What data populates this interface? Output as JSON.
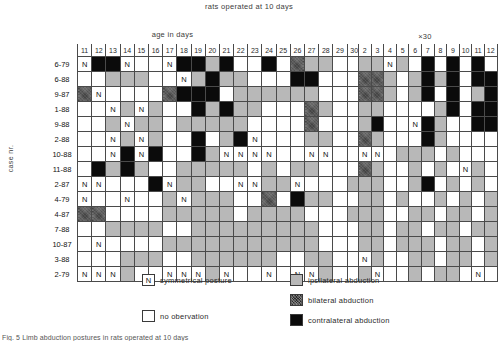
{
  "title": "rats operated at 10 days",
  "axes": {
    "x_label_left": "age in days",
    "x_label_right": "×30",
    "y_label": "case nr."
  },
  "legend": {
    "symmetrical": {
      "mark": "N",
      "label": "symmetrical posture"
    },
    "no_observation": {
      "mark": "",
      "label": "no obervation"
    },
    "ipsilateral": {
      "label": "ipsilateral abduction",
      "color": "#b8b8b8"
    },
    "bilateral": {
      "label": "bilateral abduction",
      "color": "#2b2b2b"
    },
    "contralateral": {
      "label": "contralateral abduction",
      "color": "#0b0b0b"
    }
  },
  "caption": "Fig. 5  Limb abduction postures in rats operated at 10 days",
  "chart_data": {
    "type": "heatmap",
    "title": "rats operated at 10 days",
    "xlabel": "age in days",
    "ylabel": "case nr.",
    "legend_position": "bottom",
    "states": {
      "n": "no obervation",
      "s": "symmetrical posture",
      "i": "ipsilateral abduction",
      "b": "bilateral abduction",
      "c": "contralateral abduction"
    },
    "panels": [
      {
        "name": "age-in-days",
        "xlabel": "age in days",
        "columns": [
          "11",
          "12",
          "13",
          "14",
          "15",
          "16",
          "17",
          "18",
          "19",
          "20",
          "21",
          "22",
          "23",
          "24",
          "25",
          "26",
          "27",
          "28",
          "29",
          "30",
          "31"
        ],
        "rows": [
          "6-79",
          "6-88",
          "9-87",
          "1-88",
          "9-88",
          "2-88",
          "10-88",
          "11-88",
          "2-87",
          "4-79",
          "4-87",
          "7-88",
          "10-87",
          "3-88",
          "2-79"
        ],
        "cells": [
          [
            "s",
            "c",
            "c",
            "s",
            "n",
            "n",
            "s",
            "c",
            "c",
            "i",
            "c",
            "n",
            "n",
            "c",
            "n",
            "b",
            "i",
            "i",
            "n",
            "n",
            "i"
          ],
          [
            "n",
            "n",
            "i",
            "i",
            "i",
            "n",
            "n",
            "s",
            "i",
            "c",
            "i",
            "i",
            "n",
            "n",
            "n",
            "c",
            "c",
            "n",
            "n",
            "n",
            "n"
          ],
          [
            "b",
            "s",
            "n",
            "n",
            "n",
            "n",
            "b",
            "c",
            "c",
            "c",
            "n",
            "i",
            "i",
            "i",
            "i",
            "i",
            "i",
            "n",
            "n",
            "n",
            "i"
          ],
          [
            "n",
            "n",
            "s",
            "i",
            "s",
            "i",
            "n",
            "n",
            "c",
            "i",
            "c",
            "i",
            "i",
            "n",
            "n",
            "n",
            "b",
            "i",
            "n",
            "n",
            "n"
          ],
          [
            "n",
            "n",
            "i",
            "s",
            "i",
            "i",
            "n",
            "i",
            "i",
            "i",
            "i",
            "i",
            "n",
            "n",
            "n",
            "n",
            "b",
            "n",
            "n",
            "n",
            "n"
          ],
          [
            "n",
            "n",
            "s",
            "i",
            "s",
            "i",
            "n",
            "n",
            "c",
            "n",
            "i",
            "c",
            "s",
            "n",
            "n",
            "n",
            "i",
            "i",
            "n",
            "n",
            "n"
          ],
          [
            "n",
            "n",
            "s",
            "c",
            "s",
            "c",
            "n",
            "n",
            "c",
            "i",
            "s",
            "s",
            "s",
            "s",
            "n",
            "n",
            "s",
            "s",
            "n",
            "n",
            "n"
          ],
          [
            "n",
            "c",
            "i",
            "c",
            "i",
            "n",
            "n",
            "i",
            "i",
            "i",
            "i",
            "i",
            "n",
            "i",
            "n",
            "i",
            "i",
            "n",
            "n",
            "n",
            "n"
          ],
          [
            "s",
            "s",
            "n",
            "n",
            "n",
            "c",
            "s",
            "i",
            "i",
            "n",
            "n",
            "s",
            "s",
            "i",
            "i",
            "s",
            "n",
            "n",
            "n",
            "i",
            "n"
          ],
          [
            "s",
            "n",
            "n",
            "s",
            "n",
            "n",
            "i",
            "s",
            "i",
            "i",
            "i",
            "n",
            "n",
            "b",
            "n",
            "c",
            "i",
            "i",
            "n",
            "n",
            "i"
          ],
          [
            "b",
            "b",
            "n",
            "n",
            "n",
            "n",
            "i",
            "i",
            "i",
            "i",
            "i",
            "n",
            "i",
            "i",
            "i",
            "i",
            "n",
            "n",
            "n",
            "i",
            "n"
          ],
          [
            "n",
            "n",
            "i",
            "i",
            "i",
            "i",
            "n",
            "n",
            "i",
            "i",
            "i",
            "i",
            "i",
            "i",
            "i",
            "i",
            "i",
            "n",
            "n",
            "n",
            "n"
          ],
          [
            "n",
            "s",
            "n",
            "n",
            "n",
            "n",
            "i",
            "i",
            "i",
            "i",
            "i",
            "i",
            "i",
            "i",
            "i",
            "i",
            "i",
            "n",
            "n",
            "n",
            "i"
          ],
          [
            "n",
            "n",
            "n",
            "i",
            "i",
            "i",
            "n",
            "n",
            "i",
            "i",
            "i",
            "i",
            "i",
            "i",
            "n",
            "n",
            "i",
            "i",
            "n",
            "n",
            "n"
          ],
          [
            "s",
            "s",
            "s",
            "i",
            "n",
            "n",
            "s",
            "s",
            "s",
            "i",
            "s",
            "n",
            "n",
            "s",
            "n",
            "s",
            "s",
            "i",
            "n",
            "n",
            "s"
          ]
        ]
      },
      {
        "name": "x30",
        "xlabel": "×30",
        "columns": [
          "2",
          "3",
          "4",
          "5",
          "6",
          "7",
          "8",
          "9",
          "10",
          "11",
          "12"
        ],
        "rows": [
          "6-79",
          "6-88",
          "9-87",
          "1-88",
          "9-88",
          "2-88",
          "10-88",
          "11-88",
          "2-87",
          "4-79",
          "4-87",
          "7-88",
          "10-87",
          "3-88",
          "2-79"
        ],
        "cells": [
          [
            "i",
            "i",
            "s",
            "i",
            "n",
            "c",
            "n",
            "c",
            "n",
            "c",
            "n"
          ],
          [
            "b",
            "b",
            "i",
            "n",
            "i",
            "c",
            "i",
            "c",
            "n",
            "c",
            "c"
          ],
          [
            "b",
            "b",
            "i",
            "n",
            "i",
            "c",
            "n",
            "c",
            "n",
            "i",
            "c"
          ],
          [
            "i",
            "i",
            "n",
            "n",
            "n",
            "n",
            "i",
            "c",
            "n",
            "c",
            "c"
          ],
          [
            "i",
            "c",
            "n",
            "n",
            "s",
            "c",
            "i",
            "n",
            "n",
            "c",
            "c"
          ],
          [
            "b",
            "i",
            "n",
            "n",
            "n",
            "c",
            "i",
            "n",
            "n",
            "n",
            "n"
          ],
          [
            "s",
            "s",
            "n",
            "i",
            "i",
            "i",
            "n",
            "i",
            "n",
            "n",
            "n"
          ],
          [
            "b",
            "i",
            "n",
            "n",
            "i",
            "n",
            "i",
            "n",
            "s",
            "i",
            "n"
          ],
          [
            "i",
            "i",
            "n",
            "n",
            "i",
            "c",
            "n",
            "i",
            "n",
            "i",
            "n"
          ],
          [
            "i",
            "i",
            "n",
            "i",
            "n",
            "n",
            "i",
            "n",
            "i",
            "n",
            "i"
          ],
          [
            "i",
            "i",
            "n",
            "n",
            "i",
            "i",
            "n",
            "i",
            "i",
            "n",
            "i"
          ],
          [
            "i",
            "i",
            "n",
            "i",
            "i",
            "n",
            "i",
            "i",
            "n",
            "i",
            "i"
          ],
          [
            "i",
            "i",
            "n",
            "i",
            "i",
            "i",
            "n",
            "i",
            "i",
            "n",
            "i"
          ],
          [
            "s",
            "i",
            "n",
            "n",
            "i",
            "i",
            "n",
            "i",
            "i",
            "n",
            "i"
          ],
          [
            "i",
            "s",
            "n",
            "n",
            "i",
            "n",
            "i",
            "i",
            "n",
            "s",
            "n"
          ]
        ]
      }
    ]
  }
}
